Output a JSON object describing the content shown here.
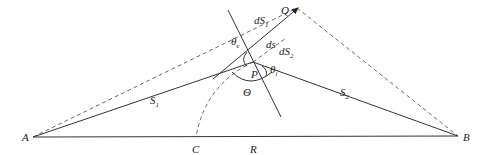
{
  "diagram": {
    "points": [
      {
        "id": "A",
        "label": "A"
      },
      {
        "id": "B",
        "label": "B"
      },
      {
        "id": "C",
        "label": "C"
      },
      {
        "id": "P",
        "label": "P"
      },
      {
        "id": "Q",
        "label": "Q"
      }
    ],
    "segments": [
      {
        "id": "S1",
        "label": "S",
        "sub": "1"
      },
      {
        "id": "S2",
        "label": "S",
        "sub": "2"
      },
      {
        "id": "R",
        "label": "R"
      },
      {
        "id": "dS1",
        "label": "dS",
        "sub": "1"
      },
      {
        "id": "dS2",
        "label": "dS",
        "sub": "2"
      },
      {
        "id": "ds",
        "label": "ds"
      }
    ],
    "angles": [
      {
        "id": "theta_e",
        "label": "θ",
        "sub": "e"
      },
      {
        "id": "theta_i",
        "label": "θ",
        "sub": "i"
      },
      {
        "id": "Theta",
        "label": "Θ"
      }
    ]
  }
}
